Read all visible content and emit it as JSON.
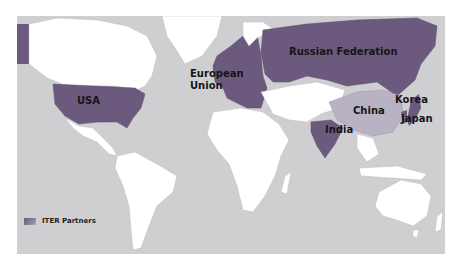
{
  "map": {
    "colors": {
      "ocean": "#cfcfd1",
      "land": "#ffffff",
      "border": "#bdbdc2",
      "partner": "#6b5a7d",
      "partner_light": "#8a7b9a",
      "nonpartner_gray": "#c4c4c6"
    },
    "labels": {
      "usa": "USA",
      "eu_line1": "European",
      "eu_line2": "Union",
      "russia": "Russian Federation",
      "china": "China",
      "korea": "Korea",
      "japan": "Japan",
      "india": "India"
    },
    "legend": {
      "icon": "partner-swatch-icon",
      "text": "ITER Partners"
    }
  }
}
